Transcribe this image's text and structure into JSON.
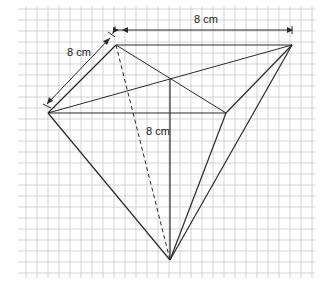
{
  "diagram": {
    "type": "pyramid-on-grid",
    "labels": {
      "top_edge": "8 cm",
      "left_edge": "8 cm",
      "height": "8 cm"
    },
    "colors": {
      "grid": "#c8c8c8",
      "line": "#2a2a2a",
      "background": "#ffffff"
    },
    "grid": {
      "x0": 22,
      "y0": 6,
      "x1": 315,
      "y1": 278,
      "step": 11
    },
    "vertices": {
      "A": [
        48,
        113
      ],
      "B": [
        116,
        45
      ],
      "C": [
        292,
        45
      ],
      "D": [
        226,
        113
      ],
      "E": [
        170,
        79
      ],
      "F": [
        170,
        260
      ]
    }
  }
}
